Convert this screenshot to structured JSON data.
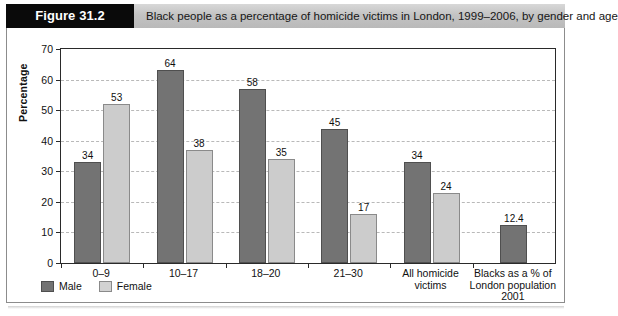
{
  "figure": {
    "tag": "Figure 31.2",
    "title": "Black people as a percentage of homicide victims in London, 1999–2006, by gender and age"
  },
  "legend": {
    "male_label": "Male",
    "female_label": "Female",
    "male_color": "#737373",
    "female_color": "#cccccc"
  },
  "chart_data": {
    "type": "bar",
    "title": "Black people as a percentage of homicide victims in London, 1999–2006, by gender and age",
    "xlabel": "",
    "ylabel": "Percentage",
    "ylim": [
      0,
      70
    ],
    "yticks": [
      0,
      10,
      20,
      30,
      40,
      50,
      60,
      70
    ],
    "ytick_labels": [
      "0",
      "10",
      "20",
      "30",
      "40",
      "50",
      "60",
      "70"
    ],
    "grid": true,
    "legend_position": "below-left",
    "categories": [
      "0–9",
      "10–17",
      "18–20",
      "21–30",
      "All homicide\nvictims",
      "Blacks as a % of\nLondon population\n2001"
    ],
    "series": [
      {
        "name": "Male",
        "color": "#737373",
        "values": [
          34,
          64,
          58,
          45,
          34,
          12.4
        ],
        "plotted": [
          33,
          63,
          57,
          44,
          33,
          12.4
        ],
        "labels": [
          "34",
          "64",
          "58",
          "45",
          "34",
          "12.4"
        ]
      },
      {
        "name": "Female",
        "color": "#cccccc",
        "values": [
          53,
          38,
          35,
          17,
          24,
          null
        ],
        "plotted": [
          52,
          37,
          34,
          16,
          23,
          null
        ],
        "labels": [
          "53",
          "38",
          "35",
          "17",
          "24",
          null
        ]
      }
    ]
  }
}
